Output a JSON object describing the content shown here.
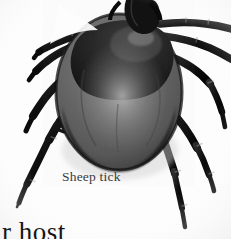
{
  "page": {
    "background_color": "#ffffff",
    "width": 231,
    "height": 239
  },
  "photo": {
    "subject": "sheep-tick",
    "description": "Black and white close-up photograph of a sheep tick with eight segmented legs",
    "body_color": "#5e5e5e",
    "body_shadow_color": "#1d1d1d",
    "leg_color": "#0f0f0f",
    "highlight_color": "#8d8d8d",
    "plate_background": "#fdfdfd"
  },
  "caption": {
    "label": "Sheep tick",
    "color": "#3a3a3a"
  },
  "surrounding_text": {
    "left_fragment": "e",
    "bottom_fragment": "ir host",
    "color": "#161616"
  }
}
